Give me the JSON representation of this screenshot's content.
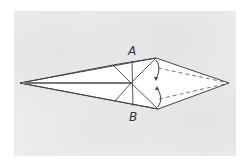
{
  "diagram": {
    "type": "origami-fold-step",
    "labels": {
      "a": "A",
      "b": "B"
    },
    "colors": {
      "background": "#ffffff",
      "paper_texture": "#ececec",
      "model_fill": "#ffffff",
      "line": "#444444",
      "center_crease": "#777777"
    },
    "points": {
      "left_tip": [
        20,
        83
      ],
      "top_vertex": [
        156,
        58
      ],
      "bottom_vertex": [
        158,
        109
      ],
      "right_tip": [
        229,
        83
      ],
      "center": [
        131,
        83
      ]
    }
  }
}
